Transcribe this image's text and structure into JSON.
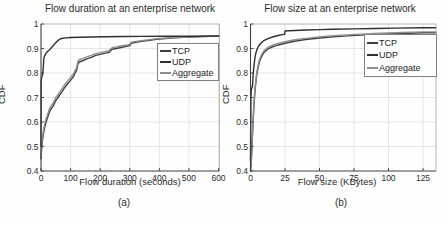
{
  "figure": {
    "background": "#fefefe",
    "text_color": "#2b2b2b",
    "grid_color": "#e0e0e0",
    "axis_color": "#3f3f3f",
    "box_color": "#b0b0b0"
  },
  "chart_data": [
    {
      "type": "line",
      "title": "Flow duration at an enterprise network",
      "xlabel": "Flow duration (seconds)",
      "ylabel": "CDF",
      "caption": "(a)",
      "xlim": [
        0,
        600
      ],
      "ylim": [
        0.4,
        1
      ],
      "x_ticks": [
        0,
        100,
        200,
        300,
        400,
        500,
        600
      ],
      "x_tick_labels": [
        "0",
        "100",
        "200",
        "300",
        "400",
        "500",
        "600"
      ],
      "y_ticks": [
        0.4,
        0.5,
        0.6,
        0.7,
        0.8,
        0.9,
        1
      ],
      "y_tick_labels": [
        "0.4",
        "0.5",
        "0.6",
        "0.7",
        "0.8",
        "0.9",
        "1"
      ],
      "grid": true,
      "legend": {
        "position": "upper-right-inside",
        "entries": [
          "TCP",
          "UDP",
          "Aggregate"
        ]
      },
      "series": [
        {
          "name": "TCP",
          "color": "#3d3d3d",
          "points": [
            [
              0,
              0.45
            ],
            [
              2,
              0.49
            ],
            [
              5,
              0.525
            ],
            [
              8,
              0.55
            ],
            [
              12,
              0.575
            ],
            [
              16,
              0.595
            ],
            [
              20,
              0.61
            ],
            [
              25,
              0.628
            ],
            [
              30,
              0.645
            ],
            [
              35,
              0.655
            ],
            [
              40,
              0.663
            ],
            [
              45,
              0.675
            ],
            [
              50,
              0.688
            ],
            [
              55,
              0.695
            ],
            [
              60,
              0.705
            ],
            [
              70,
              0.722
            ],
            [
              80,
              0.74
            ],
            [
              90,
              0.756
            ],
            [
              100,
              0.77
            ],
            [
              110,
              0.786
            ],
            [
              115,
              0.8
            ],
            [
              120,
              0.81
            ],
            [
              125,
              0.838
            ],
            [
              130,
              0.845
            ],
            [
              140,
              0.85
            ],
            [
              155,
              0.858
            ],
            [
              170,
              0.864
            ],
            [
              185,
              0.872
            ],
            [
              200,
              0.876
            ],
            [
              215,
              0.88
            ],
            [
              230,
              0.884
            ],
            [
              240,
              0.897
            ],
            [
              255,
              0.9
            ],
            [
              270,
              0.904
            ],
            [
              285,
              0.908
            ],
            [
              300,
              0.912
            ],
            [
              305,
              0.921
            ],
            [
              320,
              0.925
            ],
            [
              340,
              0.929
            ],
            [
              360,
              0.932
            ],
            [
              390,
              0.938
            ],
            [
              420,
              0.941
            ],
            [
              450,
              0.9435
            ],
            [
              480,
              0.9455
            ],
            [
              510,
              0.947
            ],
            [
              540,
              0.9485
            ],
            [
              570,
              0.9495
            ],
            [
              600,
              0.9505
            ]
          ]
        },
        {
          "name": "UDP",
          "color": "#2f2f2f",
          "points": [
            [
              0,
              0.5
            ],
            [
              0.5,
              0.77
            ],
            [
              3,
              0.785
            ],
            [
              5,
              0.792
            ],
            [
              6,
              0.8
            ],
            [
              7,
              0.812
            ],
            [
              8,
              0.83
            ],
            [
              9,
              0.85
            ],
            [
              10,
              0.862
            ],
            [
              12,
              0.87
            ],
            [
              15,
              0.876
            ],
            [
              18,
              0.882
            ],
            [
              22,
              0.888
            ],
            [
              27,
              0.893
            ],
            [
              33,
              0.9
            ],
            [
              40,
              0.91
            ],
            [
              48,
              0.921
            ],
            [
              55,
              0.93
            ],
            [
              62,
              0.937
            ],
            [
              70,
              0.941
            ],
            [
              85,
              0.9435
            ],
            [
              100,
              0.945
            ],
            [
              130,
              0.9462
            ],
            [
              170,
              0.9472
            ],
            [
              220,
              0.948
            ],
            [
              280,
              0.9488
            ],
            [
              340,
              0.9493
            ],
            [
              420,
              0.9498
            ],
            [
              500,
              0.9503
            ],
            [
              600,
              0.951
            ]
          ]
        },
        {
          "name": "Aggregate",
          "color": "#8f8f8f",
          "points": [
            [
              0,
              0.462
            ],
            [
              2,
              0.503
            ],
            [
              5,
              0.538
            ],
            [
              8,
              0.563
            ],
            [
              12,
              0.588
            ],
            [
              16,
              0.608
            ],
            [
              20,
              0.623
            ],
            [
              25,
              0.641
            ],
            [
              30,
              0.658
            ],
            [
              35,
              0.668
            ],
            [
              40,
              0.676
            ],
            [
              45,
              0.688
            ],
            [
              50,
              0.7
            ],
            [
              55,
              0.707
            ],
            [
              60,
              0.717
            ],
            [
              70,
              0.734
            ],
            [
              80,
              0.752
            ],
            [
              90,
              0.768
            ],
            [
              100,
              0.782
            ],
            [
              110,
              0.797
            ],
            [
              115,
              0.81
            ],
            [
              120,
              0.82
            ],
            [
              125,
              0.848
            ],
            [
              130,
              0.855
            ],
            [
              140,
              0.859
            ],
            [
              155,
              0.866
            ],
            [
              170,
              0.872
            ],
            [
              185,
              0.879
            ],
            [
              200,
              0.883
            ],
            [
              215,
              0.887
            ],
            [
              230,
              0.891
            ],
            [
              240,
              0.903
            ],
            [
              255,
              0.906
            ],
            [
              270,
              0.91
            ],
            [
              285,
              0.913
            ],
            [
              300,
              0.917
            ],
            [
              305,
              0.926
            ],
            [
              320,
              0.929
            ],
            [
              340,
              0.932
            ],
            [
              360,
              0.935
            ],
            [
              390,
              0.94
            ],
            [
              420,
              0.9425
            ],
            [
              450,
              0.9445
            ],
            [
              480,
              0.946
            ],
            [
              510,
              0.9475
            ],
            [
              540,
              0.949
            ],
            [
              570,
              0.95
            ],
            [
              600,
              0.951
            ]
          ]
        }
      ]
    },
    {
      "type": "line",
      "title": "Flow size at an enterprise network",
      "xlabel": "Flow size (KBytes)",
      "ylabel": "CDF",
      "caption": "(b)",
      "xlim": [
        0,
        125
      ],
      "ylim": [
        0.4,
        1
      ],
      "x_ticks": [
        0,
        25,
        50,
        75,
        100,
        125
      ],
      "x_tick_labels": [
        "0",
        "25",
        "50",
        "75",
        "100",
        "125"
      ],
      "y_ticks": [
        0.4,
        0.5,
        0.6,
        0.7,
        0.8,
        0.9,
        1
      ],
      "y_tick_labels": [
        "0.4",
        "0.5",
        "0.6",
        "0.7",
        "0.8",
        "0.9",
        "1"
      ],
      "grid": true,
      "legend": {
        "position": "upper-right-inside",
        "entries": [
          "TCP",
          "UDP",
          "Aggregate"
        ]
      },
      "series": [
        {
          "name": "TCP",
          "color": "#3d3d3d",
          "points": [
            [
              0,
              0.4
            ],
            [
              0.5,
              0.43
            ],
            [
              1,
              0.49
            ],
            [
              1.5,
              0.555
            ],
            [
              2,
              0.615
            ],
            [
              2.5,
              0.667
            ],
            [
              3,
              0.708
            ],
            [
              3.5,
              0.742
            ],
            [
              4,
              0.769
            ],
            [
              4.5,
              0.791
            ],
            [
              5,
              0.809
            ],
            [
              6,
              0.836
            ],
            [
              7,
              0.854
            ],
            [
              8,
              0.867
            ],
            [
              9,
              0.877
            ],
            [
              10,
              0.885
            ],
            [
              12,
              0.895
            ],
            [
              14,
              0.902
            ],
            [
              16,
              0.907
            ],
            [
              18,
              0.911
            ],
            [
              20,
              0.9145
            ],
            [
              25,
              0.9215
            ],
            [
              30,
              0.9275
            ],
            [
              35,
              0.9325
            ],
            [
              40,
              0.9365
            ],
            [
              50,
              0.943
            ],
            [
              60,
              0.948
            ],
            [
              70,
              0.9515
            ],
            [
              80,
              0.9545
            ],
            [
              90,
              0.957
            ],
            [
              100,
              0.9595
            ],
            [
              110,
              0.9615
            ],
            [
              125,
              0.9645
            ]
          ]
        },
        {
          "name": "UDP",
          "color": "#2f2f2f",
          "points": [
            [
              0,
              0.44
            ],
            [
              0.3,
              0.7
            ],
            [
              0.6,
              0.735
            ],
            [
              1.3,
              0.742
            ],
            [
              1.6,
              0.762
            ],
            [
              2,
              0.798
            ],
            [
              2.5,
              0.828
            ],
            [
              3,
              0.853
            ],
            [
              3.5,
              0.872
            ],
            [
              4,
              0.884
            ],
            [
              5,
              0.9
            ],
            [
              6,
              0.911
            ],
            [
              8,
              0.9245
            ],
            [
              10,
              0.9335
            ],
            [
              13,
              0.9415
            ],
            [
              16,
              0.947
            ],
            [
              20,
              0.953
            ],
            [
              24,
              0.9575
            ],
            [
              24.8,
              0.958
            ],
            [
              25,
              0.9715
            ],
            [
              28,
              0.9725
            ],
            [
              32,
              0.9735
            ],
            [
              40,
              0.9755
            ],
            [
              50,
              0.977
            ],
            [
              60,
              0.9785
            ],
            [
              75,
              0.98
            ],
            [
              90,
              0.9815
            ],
            [
              105,
              0.983
            ],
            [
              125,
              0.985
            ]
          ]
        },
        {
          "name": "Aggregate",
          "color": "#8f8f8f",
          "points": [
            [
              0,
              0.408
            ],
            [
              0.5,
              0.44
            ],
            [
              1,
              0.5
            ],
            [
              1.5,
              0.566
            ],
            [
              2,
              0.626
            ],
            [
              2.5,
              0.677
            ],
            [
              3,
              0.718
            ],
            [
              3.5,
              0.752
            ],
            [
              4,
              0.778
            ],
            [
              4.5,
              0.8
            ],
            [
              5,
              0.818
            ],
            [
              6,
              0.845
            ],
            [
              7,
              0.862
            ],
            [
              8,
              0.875
            ],
            [
              9,
              0.884
            ],
            [
              10,
              0.892
            ],
            [
              12,
              0.902
            ],
            [
              14,
              0.909
            ],
            [
              16,
              0.914
            ],
            [
              18,
              0.918
            ],
            [
              20,
              0.921
            ],
            [
              25,
              0.928
            ],
            [
              30,
              0.9335
            ],
            [
              35,
              0.938
            ],
            [
              40,
              0.9415
            ],
            [
              50,
              0.9475
            ],
            [
              60,
              0.952
            ],
            [
              70,
              0.9555
            ],
            [
              80,
              0.9585
            ],
            [
              90,
              0.961
            ],
            [
              100,
              0.9635
            ],
            [
              110,
              0.9655
            ],
            [
              125,
              0.968
            ]
          ]
        }
      ]
    }
  ]
}
